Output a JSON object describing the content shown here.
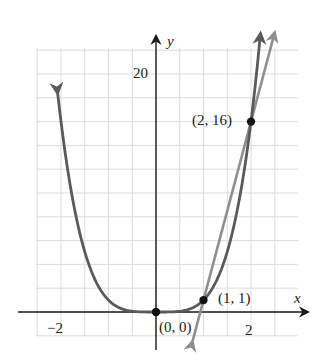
{
  "chart_data": {
    "type": "line",
    "title": "",
    "xlabel": "x",
    "ylabel": "y",
    "xlim": [
      -2.85,
      3.2
    ],
    "ylim": [
      -2,
      23
    ],
    "grid": true,
    "grid_x_step": 0.5,
    "grid_y_step": 2,
    "x_tick_labels": [
      {
        "value": -2,
        "label": "−2"
      },
      {
        "value": 2,
        "label": "2"
      }
    ],
    "y_tick_labels": [
      {
        "value": 20,
        "label": "20"
      }
    ],
    "series": [
      {
        "name": "curve y = x^4",
        "function": "x^4",
        "x_range": [
          -2.07,
          2.2
        ],
        "color": "#5a5a5a",
        "arrows": "both",
        "points": [
          [
            -2,
            16
          ],
          [
            -1.5,
            5.06
          ],
          [
            -1,
            1
          ],
          [
            -0.5,
            0.06
          ],
          [
            0,
            0
          ],
          [
            0.5,
            0.06
          ],
          [
            1,
            1
          ],
          [
            1.5,
            5.06
          ],
          [
            2,
            16
          ]
        ]
      },
      {
        "name": "secant line through (1, 1) and (2, 16)",
        "function": "15x - 14",
        "x_range": [
          0.77,
          2.5
        ],
        "color": "#8f8f8f",
        "arrows": "both",
        "points": [
          [
            1,
            1
          ],
          [
            2,
            16
          ]
        ]
      }
    ],
    "annotations": [
      {
        "point": [
          0,
          0
        ],
        "label": "(0, 0)"
      },
      {
        "point": [
          1,
          1
        ],
        "label": "(1, 1)"
      },
      {
        "point": [
          2,
          16
        ],
        "label": "(2, 16)"
      }
    ],
    "legend": null
  },
  "labels": {
    "x_axis": "x",
    "y_axis": "y",
    "tick_x_neg2": "−2",
    "tick_x_2": "2",
    "tick_y_20": "20",
    "point_origin": "(0, 0)",
    "point_1_1": "(1, 1)",
    "point_2_16": "(2, 16)"
  },
  "colors": {
    "grid": "#dcdcdc",
    "axis": "#1a1a1a",
    "curve": "#5a5a5a",
    "secant": "#8f8f8f",
    "point": "#111111"
  }
}
